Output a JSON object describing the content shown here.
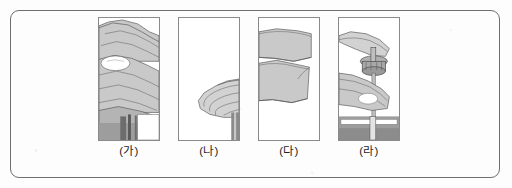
{
  "figure": {
    "type": "instructional-illustration-sequence",
    "panel_count": 4,
    "border_color": "#6e6e6e",
    "panel_border_color": "#8a8a8a",
    "ink_color": "#4a4a4a",
    "skin_fill": "#c9c9c9",
    "skin_fill_light": "#dcdcdc",
    "highlight_fill": "#ffffff",
    "dark_fill": "#8f8f8f",
    "background": "#fdfdfd"
  },
  "panels": [
    {
      "id": "a",
      "label": "(가)",
      "caption_text": "(가)",
      "scene": "hand-gripping-bottle-with-highlight",
      "order": 1
    },
    {
      "id": "b",
      "label": "(나)",
      "caption_text": "(나)",
      "scene": "hand-lowered-beside-bottle",
      "order": 2
    },
    {
      "id": "c",
      "label": "(다)",
      "caption_text": "(다)",
      "scene": "forearm-and-wrist-closeup",
      "order": 3
    },
    {
      "id": "d",
      "label": "(라)",
      "caption_text": "(라)",
      "scene": "fingers-turning-bottle-cap",
      "order": 4
    }
  ]
}
